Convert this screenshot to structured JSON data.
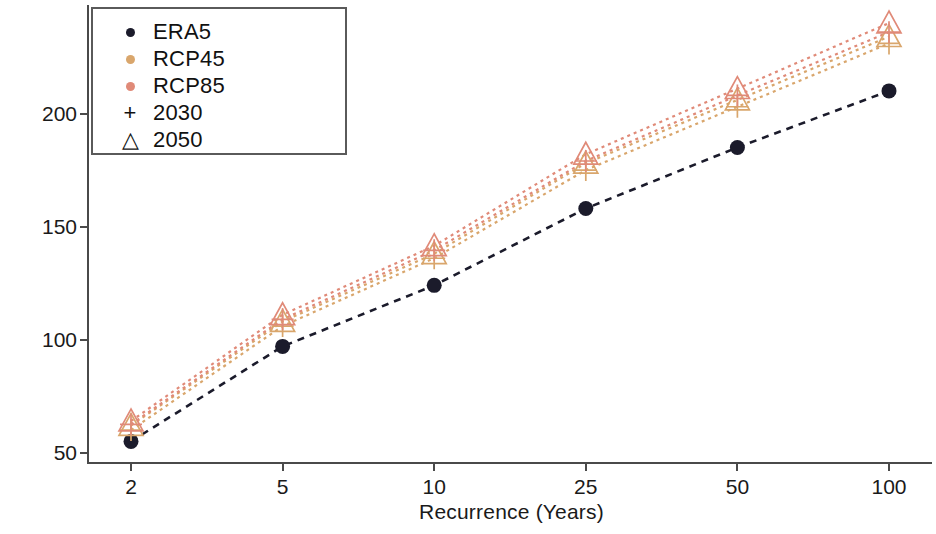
{
  "chart_data": {
    "type": "line",
    "title": "",
    "xlabel": "Recurrence (Years)",
    "ylabel": "Precipitation (mm)",
    "categories": [
      "2",
      "5",
      "10",
      "25",
      "50",
      "100"
    ],
    "xtick_labels": [
      "2",
      "5",
      "10",
      "25",
      "50",
      "100"
    ],
    "ytick_labels": [
      "50",
      "100",
      "150",
      "200"
    ],
    "ytick_values": [
      50,
      100,
      150,
      200
    ],
    "ylim": [
      45,
      248
    ],
    "grid": false,
    "legend_position": "upper-left",
    "legend_entries": [
      {
        "label": "ERA5",
        "marker": "circle",
        "color": "#1b1b2b"
      },
      {
        "label": "RCP45",
        "marker": "circle",
        "color": "#d9a66c"
      },
      {
        "label": "RCP85",
        "marker": "circle",
        "color": "#e08a78"
      },
      {
        "label": "2030",
        "marker": "plus",
        "color": "#111111"
      },
      {
        "label": "2050",
        "marker": "triangle",
        "color": "#111111"
      }
    ],
    "series": [
      {
        "name": "ERA5",
        "color": "#1b1b2b",
        "marker": "circle",
        "linestyle": "dashed",
        "values": [
          55,
          97,
          124,
          158,
          185,
          210
        ]
      },
      {
        "name": "RCP45 2030",
        "color": "#d9a66c",
        "marker": "plus",
        "linestyle": "dotted",
        "values": [
          60,
          106,
          136,
          175,
          203,
          231
        ]
      },
      {
        "name": "RCP45 2050",
        "color": "#d9a66c",
        "marker": "triangle",
        "linestyle": "dotted",
        "values": [
          62,
          108,
          138,
          178,
          206,
          234
        ]
      },
      {
        "name": "RCP85 2030",
        "color": "#e08a78",
        "marker": "plus",
        "linestyle": "dotted",
        "values": [
          62.5,
          109,
          139.5,
          179,
          208,
          236
        ]
      },
      {
        "name": "RCP85 2050",
        "color": "#e08a78",
        "marker": "triangle",
        "linestyle": "dotted",
        "values": [
          64,
          111,
          141.5,
          182,
          211,
          240
        ]
      }
    ]
  }
}
